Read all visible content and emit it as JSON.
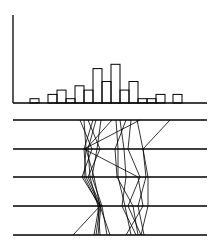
{
  "chart_data": [
    {
      "type": "bar",
      "title": "",
      "xlabel": "",
      "ylabel": "",
      "grid": false,
      "legend": null,
      "bin_width_px": 9,
      "baseline_y": 103,
      "unit_px": 4.3,
      "bins": [
        {
          "x": 30,
          "count": 1
        },
        {
          "x": 39,
          "count": 0
        },
        {
          "x": 48,
          "count": 2
        },
        {
          "x": 57,
          "count": 3
        },
        {
          "x": 66,
          "count": 1
        },
        {
          "x": 75,
          "count": 4
        },
        {
          "x": 84,
          "count": 3
        },
        {
          "x": 93,
          "count": 8
        },
        {
          "x": 102,
          "count": 5
        },
        {
          "x": 111,
          "count": 9
        },
        {
          "x": 120,
          "count": 3
        },
        {
          "x": 129,
          "count": 5
        },
        {
          "x": 138,
          "count": 1
        },
        {
          "x": 147,
          "count": 1
        },
        {
          "x": 156,
          "count": 2
        },
        {
          "x": 165,
          "count": 0
        },
        {
          "x": 173,
          "count": 2
        }
      ],
      "categories": [
        "b1",
        "b2",
        "b3",
        "b4",
        "b5",
        "b6",
        "b7",
        "b8",
        "b9",
        "b10",
        "b11",
        "b12",
        "b13",
        "b14",
        "b15",
        "b16",
        "b17"
      ],
      "values": [
        1,
        0,
        2,
        3,
        1,
        4,
        3,
        8,
        5,
        9,
        3,
        5,
        1,
        1,
        2,
        0,
        2
      ]
    },
    {
      "type": "line",
      "subtype": "parallel-coordinates",
      "title": "",
      "axes_y": [
        120,
        149,
        177,
        206,
        235
      ],
      "axis_x_range": [
        13,
        207
      ],
      "series": [
        {
          "name": "p1",
          "x": [
            80,
            92,
            82,
            100,
            96
          ]
        },
        {
          "name": "p2",
          "x": [
            84,
            86,
            84,
            99,
            94
          ]
        },
        {
          "name": "p3",
          "x": [
            88,
            100,
            88,
            101,
            98
          ]
        },
        {
          "name": "p4",
          "x": [
            93,
            84,
            86,
            100,
            73
          ]
        },
        {
          "name": "p5",
          "x": [
            96,
            88,
            90,
            98,
            100
          ]
        },
        {
          "name": "p6",
          "x": [
            101,
            97,
            92,
            102,
            107
          ]
        },
        {
          "name": "p7",
          "x": [
            112,
            86,
            94,
            100,
            110
          ]
        },
        {
          "name": "p8",
          "x": [
            116,
            118,
            118,
            125,
            131
          ]
        },
        {
          "name": "p9",
          "x": [
            120,
            124,
            126,
            122,
            136
          ]
        },
        {
          "name": "p10",
          "x": [
            126,
            115,
            117,
            133,
            138
          ]
        },
        {
          "name": "p11",
          "x": [
            131,
            128,
            140,
            128,
            141
          ]
        },
        {
          "name": "p12",
          "x": [
            137,
            143,
            146,
            138,
            144
          ]
        },
        {
          "name": "p13",
          "x": [
            140,
            84,
            138,
            143,
            126
          ]
        },
        {
          "name": "p14",
          "x": [
            170,
            143,
            148,
            148,
            141
          ]
        }
      ]
    }
  ]
}
